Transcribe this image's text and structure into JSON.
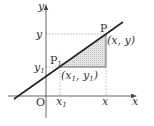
{
  "diagram": {
    "axes": {
      "x_label": "x",
      "y_label": "y",
      "origin_label": "O"
    },
    "points": {
      "P": {
        "label": "P",
        "coords": "(x, y)"
      },
      "P1": {
        "label": "P",
        "label_sub": "1",
        "coords_open": "(x",
        "coords_sub1": "1",
        "coords_mid": ", y",
        "coords_sub2": "1",
        "coords_close": ")"
      }
    },
    "ticks": {
      "x1": {
        "main": "x",
        "sub": "1"
      },
      "x": "x",
      "y1": {
        "main": "y",
        "sub": "1"
      },
      "y": "y"
    },
    "colors": {
      "line": "#222222",
      "axis": "#555555",
      "dash": "#999999",
      "shade": "#d8d8d8"
    }
  }
}
